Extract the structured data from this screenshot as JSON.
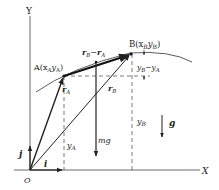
{
  "axes": {
    "x_label": "X",
    "y_label": "Y",
    "origin_label": "O"
  },
  "points": {
    "A": {
      "label": "A(x",
      "sub1": "A",
      "mid": "y",
      "sub2": "A",
      "close": ")"
    },
    "B": {
      "label": "B(x",
      "sub1": "B",
      "mid": "y",
      "sub2": "B",
      "close": ")"
    }
  },
  "vectors": {
    "rA": {
      "main": "r",
      "sub": "A"
    },
    "rB": {
      "main": "r",
      "sub": "B"
    },
    "rB_minus_rA": {
      "main1": "r",
      "sub1": "B",
      "op": "−",
      "main2": "r",
      "sub2": "A"
    },
    "i": "i",
    "j": "j",
    "mg": "mg",
    "g": "g"
  },
  "dimensions": {
    "yA": {
      "main": "y",
      "sub": "A"
    },
    "yB": {
      "main": "y",
      "sub": "B"
    },
    "yB_minus_yA": {
      "main1": "y",
      "sub1": "B",
      "op": "−",
      "main2": "y",
      "sub2": "A"
    }
  },
  "colors": {
    "ink": "#222222",
    "background": "#ffffff"
  }
}
